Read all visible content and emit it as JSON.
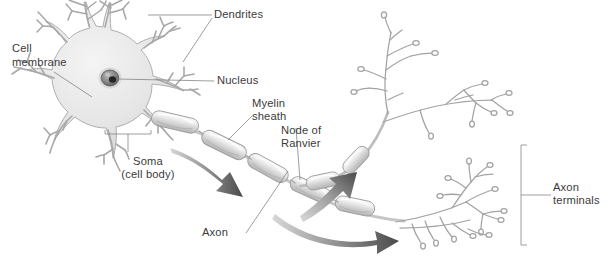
{
  "figure": {
    "background_color": "#ffffff",
    "line_color": "#9a9a9a",
    "text_color": "#3b3b3b",
    "arrow_color": "#5d5d5d",
    "soma_fill": "#e4e4e4",
    "nucleus_color": "#6f6f6f",
    "nucleolus_color": "#2e2e2e"
  },
  "labels": {
    "dendrites": "Dendrites",
    "cell_membrane_line1": "Cell",
    "cell_membrane_line2": "membrane",
    "nucleus": "Nucleus",
    "myelin_line1": "Myelin",
    "myelin_line2": "sheath",
    "node_line1": "Node of",
    "node_line2": "Ranvier",
    "soma_line1": "Soma",
    "soma_line2": "(cell body)",
    "axon": "Axon",
    "axon_terminals_line1": "Axon",
    "axon_terminals_line2": "terminals"
  },
  "parts": [
    {
      "name": "dendrites",
      "label": "Dendrites"
    },
    {
      "name": "cell-membrane",
      "label": "Cell membrane"
    },
    {
      "name": "nucleus",
      "label": "Nucleus"
    },
    {
      "name": "myelin-sheath",
      "label": "Myelin sheath"
    },
    {
      "name": "node-of-ranvier",
      "label": "Node of Ranvier"
    },
    {
      "name": "soma",
      "label": "Soma (cell body)"
    },
    {
      "name": "axon",
      "label": "Axon"
    },
    {
      "name": "axon-terminals",
      "label": "Axon terminals"
    }
  ]
}
